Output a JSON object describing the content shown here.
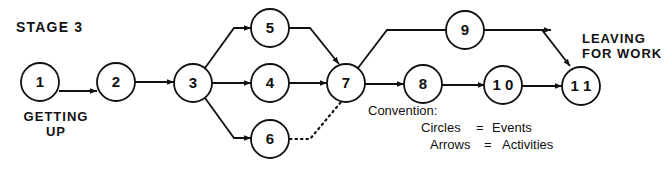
{
  "title": "STAGE 3",
  "start_label": [
    "GETTING",
    "UP"
  ],
  "end_label": [
    "LEAVING",
    "FOR WORK"
  ],
  "nodes": [
    {
      "id": "1",
      "label": "1"
    },
    {
      "id": "2",
      "label": "2"
    },
    {
      "id": "3",
      "label": "3"
    },
    {
      "id": "4",
      "label": "4"
    },
    {
      "id": "5",
      "label": "5"
    },
    {
      "id": "6",
      "label": "6"
    },
    {
      "id": "7",
      "label": "7"
    },
    {
      "id": "8",
      "label": "8"
    },
    {
      "id": "9",
      "label": "9"
    },
    {
      "id": "10",
      "label": "1 0"
    },
    {
      "id": "11",
      "label": "1 1"
    }
  ],
  "edges": [
    {
      "from": "1",
      "to": "2",
      "style": "solid"
    },
    {
      "from": "2",
      "to": "3",
      "style": "solid"
    },
    {
      "from": "3",
      "to": "5",
      "style": "solid"
    },
    {
      "from": "3",
      "to": "4",
      "style": "solid"
    },
    {
      "from": "3",
      "to": "6",
      "style": "solid"
    },
    {
      "from": "5",
      "to": "7",
      "style": "solid"
    },
    {
      "from": "4",
      "to": "7",
      "style": "solid"
    },
    {
      "from": "6",
      "to": "7",
      "style": "dotted"
    },
    {
      "from": "7",
      "to": "9",
      "style": "solid"
    },
    {
      "from": "7",
      "to": "8",
      "style": "solid"
    },
    {
      "from": "8",
      "to": "10",
      "style": "solid"
    },
    {
      "from": "9",
      "to": "11",
      "style": "solid"
    },
    {
      "from": "10",
      "to": "11",
      "style": "solid"
    }
  ],
  "convention": {
    "heading": "Convention:",
    "rows": [
      {
        "left": "Circles",
        "eq": "=",
        "right": "Events"
      },
      {
        "left": "Arrows",
        "eq": "=",
        "right": "Activities"
      }
    ]
  }
}
